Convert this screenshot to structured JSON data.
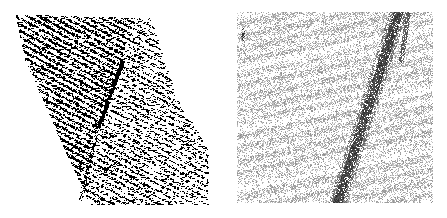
{
  "figure": {
    "background": "#ffffff",
    "panels": [
      {
        "id": "left",
        "description": "sparse black point-cloud of a tilted slab with diagonal streaks and a dark slanted defect line",
        "x": 0,
        "y": 0,
        "width": 223,
        "height": 218,
        "ink": "#000000",
        "region_polygon": [
          [
            15,
            14
          ],
          [
            150,
            18
          ],
          [
            175,
            95
          ],
          [
            208,
            150
          ],
          [
            208,
            205
          ],
          [
            90,
            205
          ],
          [
            60,
            140
          ],
          [
            25,
            60
          ]
        ],
        "streak_angle_deg": 28,
        "defect_line": {
          "from": [
            122,
            60
          ],
          "to": [
            98,
            125
          ],
          "width": 3
        }
      },
      {
        "id": "right",
        "description": "dense grey stippled square with diagonal banding and a dark diagonal stripe",
        "x": 223,
        "y": 0,
        "width": 224,
        "height": 218,
        "ink": "#2a2a2a",
        "box": [
          14,
          12,
          210,
          203
        ],
        "band_angle_deg": 12,
        "defect_stripe": {
          "from": [
            175,
            12
          ],
          "to": [
            114,
            203
          ],
          "width": 9
        },
        "branch": {
          "from": [
            185,
            12
          ],
          "to": [
            178,
            60
          ]
        }
      }
    ]
  }
}
